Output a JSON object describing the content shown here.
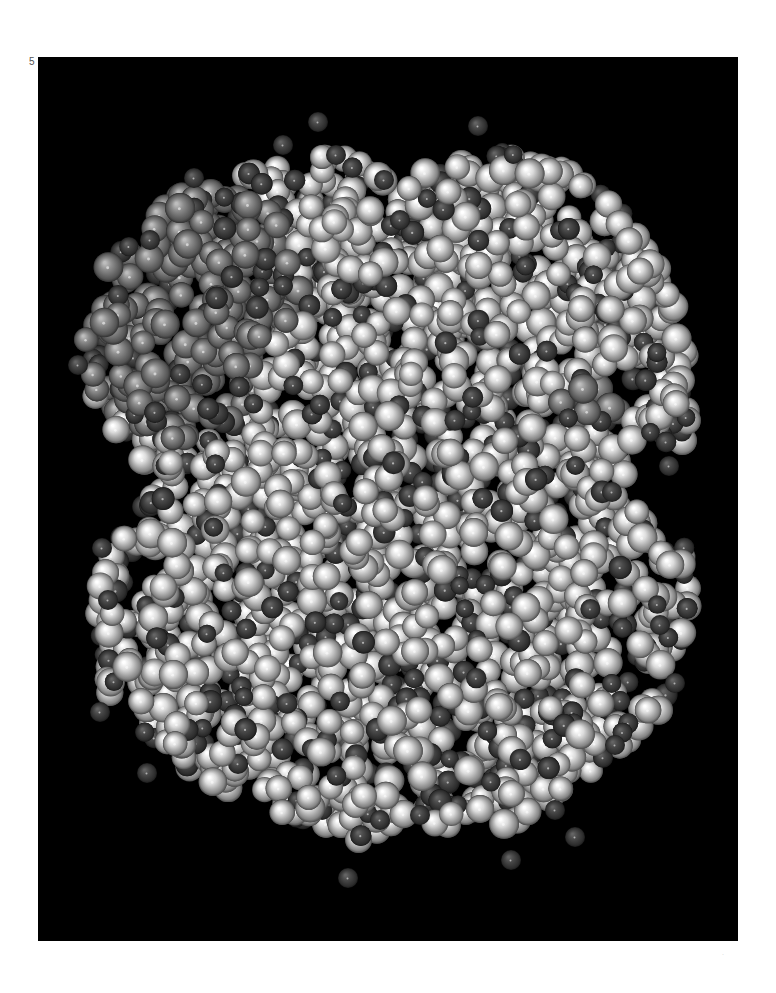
{
  "figure": {
    "label": "5",
    "page_mark": "·",
    "panel": {
      "x": 38,
      "y": 57,
      "width": 700,
      "height": 884,
      "background": "#000000"
    },
    "colors": {
      "light_atom": "#dcdcdc",
      "mid_atom": "#8c8c8c",
      "dark_atom": "#4a4a4a"
    },
    "regions": [
      {
        "name": "upper-left-lobe",
        "tone": "mid"
      },
      {
        "name": "main-body",
        "tone": "light"
      }
    ]
  }
}
